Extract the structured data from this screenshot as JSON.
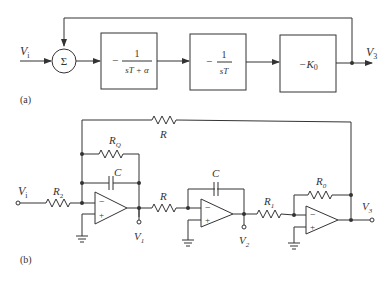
{
  "part_a": {
    "label": "(a)",
    "input_label": "V",
    "input_sub": "i",
    "output_label": "V",
    "output_sub": "3",
    "summer_symbol": "Σ",
    "blocks": [
      {
        "prefix": "−",
        "numerator": "1",
        "denominator": "sT + α"
      },
      {
        "prefix": "−",
        "numerator": "1",
        "denominator": "sT"
      },
      {
        "text": "−K",
        "sub": "0"
      }
    ]
  },
  "part_b": {
    "label": "(b)",
    "input_label": "V",
    "input_sub": "i",
    "components": {
      "R2": {
        "main": "R",
        "sub": "2"
      },
      "RQ": {
        "main": "R",
        "sub": "Q"
      },
      "C1": {
        "main": "C"
      },
      "R_feedback": {
        "main": "R"
      },
      "R_mid": {
        "main": "R"
      },
      "C2": {
        "main": "C"
      },
      "R1": {
        "main": "R",
        "sub": "1"
      },
      "R0": {
        "main": "R",
        "sub": "0"
      }
    },
    "nodes": {
      "V1": {
        "main": "V",
        "sub": "1"
      },
      "V2": {
        "main": "V",
        "sub": "2"
      },
      "V3": {
        "main": "V",
        "sub": "3"
      }
    },
    "opamp_minus": "−",
    "opamp_plus": "+"
  }
}
